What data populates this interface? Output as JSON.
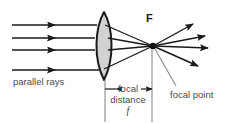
{
  "diagram": {
    "background_color": "#ffffff",
    "labels": {
      "parallel_rays": "parallel rays",
      "focal_distance": "focal distance",
      "focal_length_symbol": "f",
      "focal_point": "focal point",
      "focus_marker": "F"
    },
    "colors": {
      "ray_color": "#1a1a1a",
      "lens_outline": "#1a1a1a",
      "lens_fill": "#d2d2d2",
      "text_color": "#4a4a4a",
      "focus_label_color": "#1a1a1a",
      "thin_line_color": "#8a8a8a"
    },
    "geometry": {
      "lens_apex_top_y": 12,
      "lens_apex_bottom_y": 80,
      "lens_center_x": 104,
      "lens_half_width": 11,
      "focal_point_x": 153,
      "focal_point_y": 46,
      "incoming_ray_y_positions": [
        25,
        38,
        50,
        70
      ],
      "incoming_ray_start_x": 12,
      "dimension_line_y": 89,
      "dimension_left_x": 105,
      "dimension_right_x": 152
    },
    "elements": {
      "incoming_rays_count": 4,
      "outgoing_rays_count": 4,
      "lens_type": "biconvex",
      "focal_point_marker": "dot"
    }
  }
}
